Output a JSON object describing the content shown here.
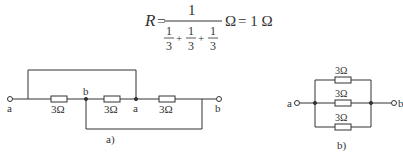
{
  "formula": {
    "lhs": "R",
    "eq": "=",
    "numerator": "1",
    "den_terms": [
      {
        "num": "1",
        "den": "3"
      },
      {
        "num": "1",
        "den": "3"
      },
      {
        "num": "1",
        "den": "3"
      }
    ],
    "plus": "+",
    "unit": "Ω",
    "result": "= 1 Ω"
  },
  "circuit_a": {
    "caption": "a)",
    "terminal_left": "a",
    "terminal_right": "b",
    "node_1": "b",
    "node_2": "a",
    "resistors": [
      "3Ω",
      "3Ω",
      "3Ω"
    ]
  },
  "circuit_b": {
    "caption": "b)",
    "terminal_left": "a",
    "terminal_right": "b",
    "resistors": [
      "3Ω",
      "3Ω",
      "3Ω"
    ]
  }
}
